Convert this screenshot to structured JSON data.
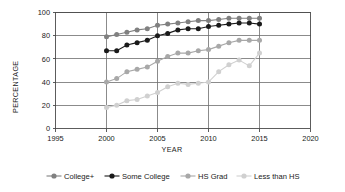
{
  "chart_data": {
    "type": "line",
    "title": "",
    "xlabel": "YEAR",
    "ylabel": "PERCENTAGE",
    "xlim": [
      1995,
      2020
    ],
    "ylim": [
      0,
      100
    ],
    "xticks": [
      1995,
      2000,
      2005,
      2010,
      2015,
      2020
    ],
    "yticks": [
      0,
      20,
      40,
      60,
      80,
      100
    ],
    "grid": true,
    "legend_position": "bottom",
    "x": [
      2000,
      2001,
      2002,
      2003,
      2004,
      2005,
      2006,
      2007,
      2008,
      2009,
      2010,
      2011,
      2012,
      2013,
      2014,
      2015
    ],
    "series": [
      {
        "name": "College+",
        "color": "#808080",
        "values": [
          79,
          81,
          83,
          85,
          86,
          89,
          90,
          91,
          92,
          93,
          93,
          94,
          95,
          95,
          95,
          95
        ]
      },
      {
        "name": "Some College",
        "color": "#1a1a1a",
        "values": [
          67,
          67,
          72,
          74,
          76,
          80,
          82,
          85,
          86,
          86,
          88,
          89,
          90,
          91,
          91,
          90
        ]
      },
      {
        "name": "HS Grad",
        "color": "#a8a8a8",
        "values": [
          40,
          43,
          49,
          51,
          53,
          58,
          62,
          65,
          65,
          67,
          68,
          71,
          74,
          76,
          76,
          76
        ]
      },
      {
        "name": "Less than HS",
        "color": "#d0d0d0",
        "values": [
          18,
          20,
          24,
          25,
          28,
          31,
          36,
          39,
          38,
          39,
          40,
          49,
          55,
          59,
          54,
          65
        ]
      }
    ]
  },
  "axes": {
    "ylabel": "PERCENTAGE",
    "xlabel": "YEAR",
    "ytick_labels": [
      "100",
      "80",
      "60",
      "40",
      "20",
      "0"
    ],
    "xtick_labels": [
      "1995",
      "2000",
      "2005",
      "2010",
      "2015",
      "2020"
    ]
  },
  "legend": {
    "items": [
      {
        "label": "College+",
        "color": "#808080"
      },
      {
        "label": "Some College",
        "color": "#1a1a1a"
      },
      {
        "label": "HS Grad",
        "color": "#a8a8a8"
      },
      {
        "label": "Less than HS",
        "color": "#d0d0d0"
      }
    ]
  }
}
